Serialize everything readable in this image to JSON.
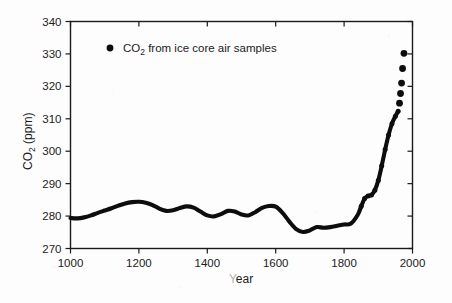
{
  "chart_data": {
    "type": "line",
    "title": "",
    "subtitle": "",
    "xlabel": "Year",
    "ylabel": "CO2 (ppm)",
    "ylabel_parts": {
      "lead": "CO",
      "sub": "2",
      "tail": " (ppm)"
    },
    "xlim": [
      1000,
      2000
    ],
    "ylim": [
      270,
      340
    ],
    "xticks": [
      1000,
      1200,
      1400,
      1600,
      1800,
      2000
    ],
    "xtick_labels": [
      "1000",
      "1200",
      "1400",
      "1600",
      "1800",
      "2000"
    ],
    "yticks": [
      270,
      280,
      290,
      300,
      310,
      320,
      330,
      340
    ],
    "ytick_labels": [
      "270",
      "280",
      "290",
      "300",
      "310",
      "320",
      "330",
      "340"
    ],
    "grid": false,
    "legend_position": "upper-left",
    "legend": [
      {
        "name": "CO2 from ice core air samples",
        "name_parts": {
          "lead": "CO",
          "sub": "2",
          "tail": " from ice core air samples"
        },
        "marker": "filled-circle",
        "color": "#0d0d0d"
      }
    ],
    "series": [
      {
        "name": "CO2 from ice core air samples",
        "style": "thick-line-with-dense-markers",
        "color": "#0d0d0d",
        "x": [
          1000,
          1020,
          1040,
          1060,
          1080,
          1100,
          1120,
          1140,
          1160,
          1180,
          1200,
          1220,
          1240,
          1260,
          1280,
          1300,
          1320,
          1340,
          1360,
          1380,
          1400,
          1420,
          1440,
          1460,
          1480,
          1500,
          1520,
          1540,
          1560,
          1580,
          1600,
          1620,
          1640,
          1660,
          1680,
          1700,
          1720,
          1740,
          1760,
          1780,
          1800,
          1820,
          1840,
          1850,
          1860,
          1870,
          1880,
          1890,
          1900,
          1910,
          1920,
          1930,
          1940,
          1950,
          1958
        ],
        "y": [
          279.4,
          279.3,
          279.6,
          280.2,
          281.0,
          281.7,
          282.4,
          283.2,
          283.9,
          284.3,
          284.4,
          284.1,
          283.4,
          282.3,
          281.6,
          281.8,
          282.5,
          283.0,
          282.6,
          281.4,
          280.2,
          279.9,
          280.6,
          281.6,
          281.4,
          280.5,
          280.2,
          281.2,
          282.5,
          283.1,
          282.9,
          281.0,
          278.3,
          276.0,
          275.1,
          275.6,
          276.6,
          276.4,
          276.6,
          277.0,
          277.4,
          277.7,
          280.4,
          283.0,
          285.4,
          286.2,
          286.5,
          288.0,
          291.0,
          295.5,
          300.5,
          305.0,
          308.5,
          310.8,
          312.3
        ]
      },
      {
        "name": "Modern discrete ice core samples",
        "style": "separated-markers",
        "color": "#0d0d0d",
        "x": [
          1962,
          1965,
          1968,
          1971,
          1975
        ],
        "y": [
          314.8,
          317.8,
          321.0,
          325.5,
          330.2
        ]
      }
    ],
    "annotations": []
  }
}
